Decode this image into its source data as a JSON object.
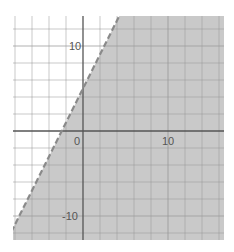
{
  "chart_data": {
    "type": "line",
    "title": "",
    "xlabel": "",
    "ylabel": "",
    "boundary": {
      "equation": "y = 2x + 5",
      "slope": 2,
      "intercept": 5,
      "style": "dashed"
    },
    "shaded_region": "below-right",
    "xlim": [
      -8.2,
      16.6
    ],
    "ylim": [
      -12.8,
      13.5
    ],
    "grid": true,
    "grid_step": 2,
    "x_tick_labels": [
      {
        "value": 0,
        "label": "0"
      },
      {
        "value": 10,
        "label": "10"
      }
    ],
    "y_tick_labels": [
      {
        "value": 10,
        "label": "10"
      },
      {
        "value": -10,
        "label": "-10"
      }
    ],
    "line_points": [
      {
        "x": -8.2,
        "y": -11.4
      },
      {
        "x": 4.25,
        "y": 13.5
      }
    ]
  },
  "colors": {
    "shade": "#c9c9c9",
    "grid_on_white": "#cfcfcf",
    "grid_on_shade": "#9a9a9a",
    "axis": "#555555",
    "boundary_line": "#8a8a8a"
  },
  "labels": {
    "origin": "0",
    "x_ten": "10",
    "y_ten": "10",
    "y_neg_ten": "-10"
  }
}
